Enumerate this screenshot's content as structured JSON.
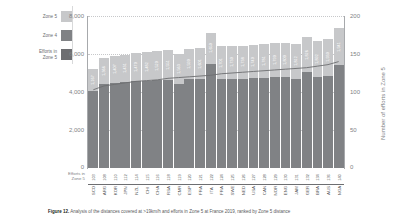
{
  "figure": {
    "caption_label": "Figure 12.",
    "caption_text": " Analysis of the distances covered at >19km/h and efforts in Zone 5 at France 2019, ranked by Zone 5 distance"
  },
  "legend": {
    "items": [
      {
        "label": "Zone 5",
        "color": "#c7c8ca",
        "name": "zone-5"
      },
      {
        "label": "Zone 4",
        "color": "#808285",
        "name": "zone-4"
      },
      {
        "label": "Efforts in\nZone 5",
        "color": "#6d6e71",
        "name": "efforts-in-zone-5"
      }
    ]
  },
  "axes": {
    "left_title": "Distance (m)",
    "right_title": "Number of efforts in Zone 5",
    "left_ticks": [
      "8,000",
      "6,000",
      "4,000",
      "2,000",
      "0"
    ],
    "right_ticks": [
      "200",
      "150",
      "100",
      "50",
      "0"
    ],
    "efforts_row_label": "Efforts in\nZone 5"
  },
  "chart_data": {
    "type": "bar",
    "title": "Analysis of the distances covered at >19km/h and efforts in Zone 5 at France 2019, ranked by Zone 5 distance",
    "xlabel": "",
    "ylabel": "Distance (m)",
    "y2label": "Number of efforts in Zone 5",
    "ylim": [
      0,
      8000
    ],
    "y2lim": [
      0,
      200
    ],
    "grid": true,
    "legend_position": "left",
    "categories": [
      "SCO",
      "ARG",
      "KOR",
      "JPN",
      "NZL",
      "CHI",
      "CHA",
      "RSA",
      "CMR",
      "ESP",
      "FRA",
      "ITA",
      "FRA",
      "SWE",
      "NED",
      "USA",
      "CAN",
      "NOR",
      "ENG",
      "JAM",
      "GER",
      "BRA",
      "AUS",
      "NGA"
    ],
    "series": [
      {
        "name": "Zone 4",
        "color": "#808285",
        "values": [
          4050,
          4430,
          4500,
          4530,
          4560,
          4600,
          4620,
          4650,
          4430,
          4680,
          4700,
          5480,
          4700,
          4690,
          4700,
          4720,
          4760,
          4780,
          4800,
          4700,
          5060,
          4780,
          4860,
          5420
        ]
      },
      {
        "name": "Zone 5",
        "color": "#c7c8ca",
        "values": [
          1167,
          1366,
          1407,
          1431,
          1470,
          1482,
          1520,
          1551,
          1563,
          1590,
          1601,
          1650,
          1701,
          1730,
          1738,
          1740,
          1781,
          1790,
          1800,
          1812,
          1826,
          1892,
          1930,
          1941
        ]
      }
    ],
    "bar_value_labels": [
      "1,167",
      "1,366",
      "1,407",
      "1,431",
      "1,470",
      "1,482",
      "1,520",
      "1,551",
      "1,563",
      "1,590",
      "1,601",
      "1,650",
      "1,701",
      "1,730",
      "1,738",
      "1,740",
      "1,781",
      "1,790",
      "1,800",
      "1,812",
      "1,826",
      "1,892",
      "1,930",
      "1,941"
    ],
    "efforts_line": {
      "name": "Efforts in Zone 5",
      "color": "#6d6e71",
      "values": [
        103,
        108,
        110,
        112,
        114,
        115,
        116,
        118,
        119,
        120,
        121,
        122,
        124,
        125,
        126,
        127,
        128,
        129,
        130,
        131,
        132,
        134,
        136,
        140
      ]
    },
    "efforts_row_values": [
      "103",
      "108",
      "110",
      "112",
      "114",
      "115",
      "116",
      "118",
      "119",
      "120",
      "121",
      "122",
      "124",
      "125",
      "126",
      "127",
      "128",
      "129",
      "130",
      "131",
      "132",
      "134",
      "136",
      "140"
    ]
  }
}
